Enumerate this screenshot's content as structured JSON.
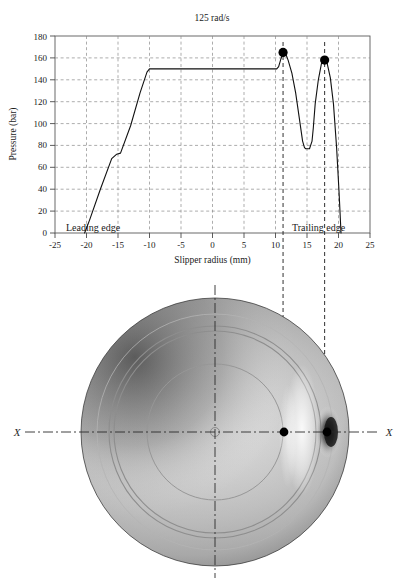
{
  "figure": {
    "panels": [
      "pressure-chart",
      "slipper-photo"
    ]
  },
  "chart_data": {
    "type": "line",
    "title": "125 rad/s",
    "xlabel": "Slipper radius (mm)",
    "ylabel": "Pressure (bar)",
    "xlim": [
      -25,
      25
    ],
    "ylim": [
      0,
      180
    ],
    "xticks": [
      "-25",
      "-20",
      "-15",
      "-10",
      "-5",
      "0",
      "5",
      "10",
      "15",
      "20",
      "25"
    ],
    "xtick_values": [
      -25,
      -20,
      -15,
      -10,
      -5,
      0,
      5,
      10,
      15,
      20,
      25
    ],
    "yticks": [
      "0",
      "20",
      "40",
      "60",
      "80",
      "100",
      "120",
      "140",
      "160",
      "180"
    ],
    "ytick_values": [
      0,
      20,
      40,
      60,
      80,
      100,
      120,
      140,
      160,
      180
    ],
    "grid": "dashed-both-axes",
    "legend": "none",
    "series": [
      {
        "name": "Pressure profile at 125 rad/s",
        "x": [
          -20.3,
          -19.5,
          -17.8,
          -16.0,
          -15.2,
          -14.6,
          -13.0,
          -11.5,
          -10.4,
          -10.0,
          10.2,
          10.5,
          10.8,
          11.2,
          11.6,
          12.0,
          12.6,
          13.2,
          13.8,
          14.3,
          14.6,
          14.8,
          15.4,
          15.8,
          16.0,
          16.3,
          16.8,
          17.3,
          17.8,
          18.2,
          18.7,
          19.2,
          19.7,
          20.1,
          20.4
        ],
        "y": [
          0,
          12,
          40,
          68,
          72,
          73,
          98,
          128,
          147,
          150,
          150,
          152,
          158,
          165,
          164,
          158,
          146,
          128,
          104,
          84,
          78,
          77,
          77,
          84,
          96,
          118,
          140,
          155,
          158,
          155,
          142,
          118,
          78,
          36,
          0
        ]
      }
    ],
    "markers": [
      {
        "name": "peak-1-marker",
        "x": 11.2,
        "y": 165
      },
      {
        "name": "peak-2-marker",
        "x": 17.8,
        "y": 158
      }
    ],
    "vertical_reference_lines": [
      {
        "name": "ref-line-peak-1",
        "x": 11.2
      },
      {
        "name": "ref-line-peak-2",
        "x": 17.8
      }
    ],
    "annotations": [
      {
        "name": "leading-edge-label",
        "text": "Leading edge",
        "x": -21.0,
        "y": 10
      },
      {
        "name": "trailing-edge-label",
        "text": "Trailing edge",
        "x": 12.8,
        "y": 10
      }
    ]
  },
  "photo": {
    "caption_left": "X",
    "caption_right": "X",
    "markers": [
      {
        "name": "photo-marker-inner"
      },
      {
        "name": "photo-marker-outer"
      }
    ],
    "centerline_h": "horizontal-centerline",
    "centerline_v": "vertical-centerline"
  },
  "colors": {
    "ink": "#1a1a1a",
    "grid": "#7a7a7a",
    "axis": "#555555",
    "curve": "#111111",
    "marker": "#000000"
  }
}
